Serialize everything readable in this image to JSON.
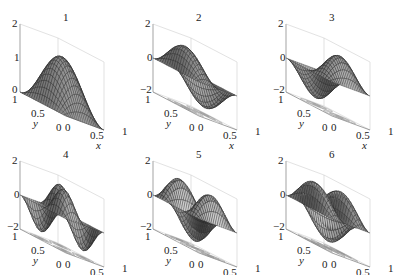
{
  "chart_data": [
    {
      "type": "surface",
      "title": "1",
      "mode": [
        1,
        1
      ],
      "fn": "sin(pi x) sin(pi y) * 1.6 (offset >= 0)",
      "zlim": [
        0,
        2
      ],
      "zticks": [
        "2",
        "1",
        "0"
      ],
      "xticks": [
        "0",
        "0.5",
        "1"
      ],
      "yticks": [
        "1",
        "0.5",
        "0"
      ],
      "xlabel": "x",
      "ylabel": "y",
      "contour": false
    },
    {
      "type": "surface",
      "title": "2",
      "mode": [
        2,
        1
      ],
      "fn": "sin(2 pi x) sin(pi y)",
      "zlim": [
        -2,
        2
      ],
      "zticks": [
        "2",
        "0",
        "-2"
      ],
      "xticks": [
        "0",
        "0.5",
        "1"
      ],
      "yticks": [
        "1",
        "0.5",
        "0"
      ],
      "xlabel": "x",
      "ylabel": "y",
      "contour": true
    },
    {
      "type": "surface",
      "title": "3",
      "mode": [
        1,
        2
      ],
      "fn": "sin(pi x) sin(2 pi y)",
      "zlim": [
        -2,
        2
      ],
      "zticks": [
        "2",
        "0",
        "-2"
      ],
      "xticks": [
        "0",
        "0.5",
        "1"
      ],
      "yticks": [
        "1",
        "0.5",
        "0"
      ],
      "xlabel": "x",
      "ylabel": "y",
      "contour": true
    },
    {
      "type": "surface",
      "title": "4",
      "mode": [
        2,
        2
      ],
      "fn": "sin(2 pi x) sin(2 pi y)",
      "zlim": [
        -2,
        2
      ],
      "zticks": [
        "2",
        "0",
        "-2"
      ],
      "xticks": [
        "0",
        "0.5",
        "1"
      ],
      "yticks": [
        "1",
        "0.5",
        "0"
      ],
      "xlabel": "x",
      "ylabel": "y",
      "contour": true
    },
    {
      "type": "surface",
      "title": "5",
      "mode": [
        1,
        3
      ],
      "fn": "sin(pi x) sin(3 pi y)",
      "zlim": [
        -2,
        2
      ],
      "zticks": [
        "2",
        "0",
        "-2"
      ],
      "xticks": [
        "0",
        "0.5",
        "1"
      ],
      "yticks": [
        "1",
        "0.5",
        "0"
      ],
      "xlabel": "x",
      "ylabel": "y",
      "contour": true
    },
    {
      "type": "surface",
      "title": "6",
      "mode": [
        3,
        1
      ],
      "fn": "sin(3 pi x) sin(pi y)",
      "zlim": [
        -2,
        2
      ],
      "zticks": [
        "2",
        "0",
        "-2"
      ],
      "xticks": [
        "0",
        "0.5",
        "1"
      ],
      "yticks": [
        "1",
        "0.5",
        "0"
      ],
      "xlabel": "x",
      "ylabel": "y",
      "contour": true
    }
  ],
  "layout": {
    "rows": 2,
    "cols": 3,
    "grid": true
  }
}
